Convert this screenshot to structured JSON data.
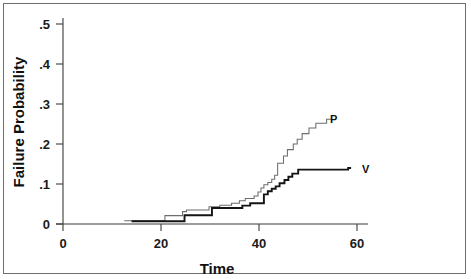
{
  "chart_data": {
    "type": "line",
    "subtype": "step-kaplan-meier-failure",
    "title": "",
    "xlabel": "Time",
    "ylabel": "Failure Probability",
    "xlim": [
      0,
      62
    ],
    "ylim": [
      0,
      0.5
    ],
    "grid": false,
    "legend_position": "right-inline-labels",
    "xticks": [
      0,
      20,
      40,
      60
    ],
    "xticklabels": [
      "0",
      "20",
      "40",
      "60"
    ],
    "yticks": [
      0,
      0.1,
      0.2,
      0.3,
      0.4,
      0.5
    ],
    "yticklabels": [
      "0",
      ".1",
      ".2",
      ".3",
      ".4",
      ".5"
    ],
    "series": [
      {
        "name": "P",
        "label": "P",
        "color": "#6d6d6d",
        "linewidth": 1.05,
        "label_x": 54.5,
        "label_y": 0.262,
        "points": [
          [
            12.5,
            0.008
          ],
          [
            20.8,
            0.008
          ],
          [
            20.8,
            0.021
          ],
          [
            24.4,
            0.021
          ],
          [
            24.4,
            0.031
          ],
          [
            25.2,
            0.031
          ],
          [
            25.2,
            0.035
          ],
          [
            29.8,
            0.035
          ],
          [
            29.8,
            0.043
          ],
          [
            32.0,
            0.043
          ],
          [
            32.0,
            0.047
          ],
          [
            34.4,
            0.047
          ],
          [
            34.4,
            0.052
          ],
          [
            36.0,
            0.052
          ],
          [
            36.0,
            0.058
          ],
          [
            37.2,
            0.058
          ],
          [
            37.2,
            0.064
          ],
          [
            39.0,
            0.064
          ],
          [
            39.0,
            0.07
          ],
          [
            39.8,
            0.07
          ],
          [
            39.8,
            0.08
          ],
          [
            40.4,
            0.08
          ],
          [
            40.4,
            0.09
          ],
          [
            41.0,
            0.09
          ],
          [
            41.0,
            0.098
          ],
          [
            41.8,
            0.098
          ],
          [
            41.8,
            0.104
          ],
          [
            42.6,
            0.104
          ],
          [
            42.6,
            0.112
          ],
          [
            43.2,
            0.112
          ],
          [
            43.2,
            0.122
          ],
          [
            43.8,
            0.122
          ],
          [
            43.8,
            0.152
          ],
          [
            45.0,
            0.152
          ],
          [
            45.0,
            0.17
          ],
          [
            45.8,
            0.17
          ],
          [
            45.8,
            0.186
          ],
          [
            47.0,
            0.186
          ],
          [
            47.0,
            0.2
          ],
          [
            47.8,
            0.2
          ],
          [
            47.8,
            0.212
          ],
          [
            48.8,
            0.212
          ],
          [
            48.8,
            0.226
          ],
          [
            50.2,
            0.226
          ],
          [
            50.2,
            0.24
          ],
          [
            51.6,
            0.24
          ],
          [
            51.6,
            0.252
          ],
          [
            53.8,
            0.252
          ],
          [
            53.8,
            0.262
          ],
          [
            55.0,
            0.262
          ]
        ]
      },
      {
        "name": "V",
        "label": "V",
        "color": "#141414",
        "linewidth": 1.9,
        "label_x": 61.0,
        "label_y": 0.138,
        "points": [
          [
            14.0,
            0.007
          ],
          [
            24.8,
            0.007
          ],
          [
            24.8,
            0.022
          ],
          [
            30.4,
            0.022
          ],
          [
            30.4,
            0.04
          ],
          [
            36.6,
            0.04
          ],
          [
            36.6,
            0.046
          ],
          [
            38.2,
            0.046
          ],
          [
            38.2,
            0.052
          ],
          [
            41.0,
            0.052
          ],
          [
            41.0,
            0.074
          ],
          [
            41.8,
            0.074
          ],
          [
            41.8,
            0.082
          ],
          [
            42.6,
            0.082
          ],
          [
            42.6,
            0.088
          ],
          [
            43.4,
            0.088
          ],
          [
            43.4,
            0.094
          ],
          [
            44.2,
            0.094
          ],
          [
            44.2,
            0.102
          ],
          [
            45.2,
            0.102
          ],
          [
            45.2,
            0.11
          ],
          [
            46.0,
            0.11
          ],
          [
            46.0,
            0.118
          ],
          [
            46.8,
            0.118
          ],
          [
            46.8,
            0.126
          ],
          [
            48.0,
            0.126
          ],
          [
            48.0,
            0.136
          ],
          [
            58.2,
            0.136
          ],
          [
            58.2,
            0.14
          ],
          [
            58.8,
            0.14
          ]
        ]
      }
    ]
  },
  "axis": {
    "xlabel": "Time",
    "ylabel": "Failure Probability"
  }
}
